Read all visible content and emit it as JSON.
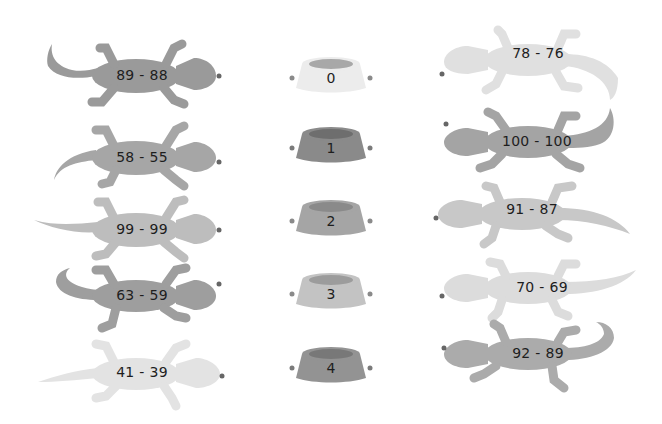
{
  "worksheet": {
    "instructions_visible": false,
    "left_geckos": [
      {
        "expression": "89 - 88",
        "color": "#9a9a9a"
      },
      {
        "expression": "58 - 55",
        "color": "#a6a6a6"
      },
      {
        "expression": "99 - 99",
        "color": "#bdbdbd"
      },
      {
        "expression": "63 - 59",
        "color": "#9e9e9e"
      },
      {
        "expression": "41 - 39",
        "color": "#e3e3e3"
      }
    ],
    "bowls": [
      {
        "number": "0",
        "color": "#ececec"
      },
      {
        "number": "1",
        "color": "#8a8a8a"
      },
      {
        "number": "2",
        "color": "#a5a5a5"
      },
      {
        "number": "3",
        "color": "#c3c3c3"
      },
      {
        "number": "4",
        "color": "#939393"
      }
    ],
    "right_geckos": [
      {
        "expression": "78 - 76",
        "color": "#e0e0e0"
      },
      {
        "expression": "100 - 100",
        "color": "#a4a4a4"
      },
      {
        "expression": "91 - 87",
        "color": "#c8c8c8"
      },
      {
        "expression": "70 - 69",
        "color": "#dcdcdc"
      },
      {
        "expression": "92 - 89",
        "color": "#ababab"
      }
    ]
  }
}
